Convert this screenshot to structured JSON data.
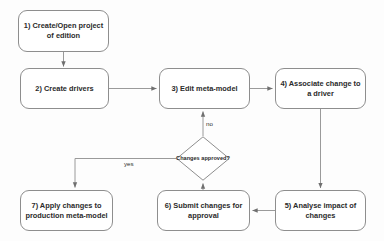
{
  "diagram": {
    "type": "flowchart",
    "canvas": {
      "width": 384,
      "height": 241
    },
    "style": {
      "background": "#fdfdfd",
      "node_fill": "#ffffff",
      "node_stroke": "#8e8e8e",
      "text_color": "#2b2b2b",
      "edge_stroke": "#9a9a9a"
    },
    "nodes": [
      {
        "id": "n1",
        "shape": "rounded-rect",
        "label": "1) Create/Open project of edition",
        "x": 18,
        "y": 10,
        "w": 91,
        "h": 42
      },
      {
        "id": "n2",
        "shape": "rounded-rect",
        "label": "2) Create drivers",
        "x": 20,
        "y": 68,
        "w": 89,
        "h": 41
      },
      {
        "id": "n3",
        "shape": "rounded-rect",
        "label": "3) Edit meta-model",
        "x": 159,
        "y": 68,
        "w": 91,
        "h": 41
      },
      {
        "id": "n4",
        "shape": "rounded-rect",
        "label": "4) Associate change to a driver",
        "x": 275,
        "y": 68,
        "w": 91,
        "h": 41
      },
      {
        "id": "n5",
        "shape": "rounded-rect",
        "label": "5) Analyse impact of changes",
        "x": 275,
        "y": 190,
        "w": 91,
        "h": 41
      },
      {
        "id": "n6",
        "shape": "rounded-rect",
        "label": "6) Submit changes for approval",
        "x": 157,
        "y": 190,
        "w": 93,
        "h": 41
      },
      {
        "id": "n7",
        "shape": "rounded-rect",
        "label": "7) Apply changes to production meta-model",
        "x": 20,
        "y": 190,
        "w": 93,
        "h": 41
      },
      {
        "id": "d1",
        "shape": "diamond",
        "label": "Changes approved?",
        "x": 176,
        "y": 136,
        "w": 54,
        "h": 45
      }
    ],
    "edges": [
      {
        "id": "e1",
        "from": "n1",
        "to": "n2",
        "label": ""
      },
      {
        "id": "e2",
        "from": "n2",
        "to": "n3",
        "label": ""
      },
      {
        "id": "e3",
        "from": "n3",
        "to": "n4",
        "label": ""
      },
      {
        "id": "e4",
        "from": "n4",
        "to": "n5",
        "label": ""
      },
      {
        "id": "e5",
        "from": "n5",
        "to": "n6",
        "label": ""
      },
      {
        "id": "e6",
        "from": "n6",
        "to": "d1",
        "label": ""
      },
      {
        "id": "e7",
        "from": "d1",
        "to": "n3",
        "label": "no"
      },
      {
        "id": "e8",
        "from": "d1",
        "to": "n7",
        "label": "yes"
      }
    ],
    "edge_labels": {
      "no": "no",
      "yes": "yes"
    }
  }
}
